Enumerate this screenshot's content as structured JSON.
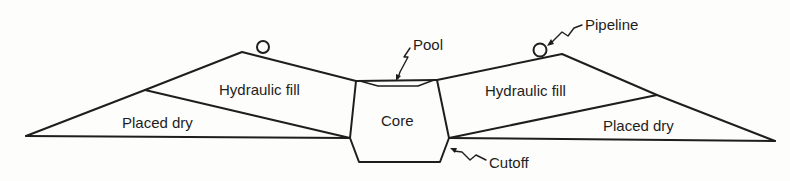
{
  "figure": {
    "type": "dam cross-section",
    "labels": {
      "left_hydraulic_fill": "Hydraulic fill",
      "left_placed_dry": "Placed dry",
      "core": "Core",
      "pool": "Pool",
      "right_hydraulic_fill": "Hydraulic fill",
      "right_placed_dry": "Placed dry",
      "pipeline": "Pipeline",
      "cutoff": "Cutoff"
    },
    "colors": {
      "line": "#1e1e1e",
      "background": "#fdfdfb"
    }
  }
}
